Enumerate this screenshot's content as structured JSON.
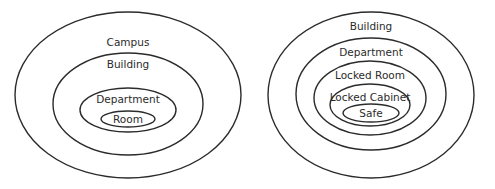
{
  "diagrams": [
    {
      "name": "campus-hierarchy",
      "levels": [
        {
          "label": "Campus",
          "cx": 128,
          "cy": 95,
          "rx": 113,
          "ry": 83,
          "tx": 128,
          "ty": 46
        },
        {
          "label": "Building",
          "cx": 128,
          "cy": 104,
          "rx": 75,
          "ry": 51,
          "tx": 128,
          "ty": 68
        },
        {
          "label": "Department",
          "cx": 128,
          "cy": 110,
          "rx": 48,
          "ry": 22,
          "tx": 128,
          "ty": 103
        },
        {
          "label": "Room",
          "cx": 128,
          "cy": 119,
          "rx": 27,
          "ry": 8,
          "tx": 128,
          "ty": 123
        }
      ]
    },
    {
      "name": "building-hierarchy",
      "levels": [
        {
          "label": "Building",
          "cx": 371,
          "cy": 95,
          "rx": 103,
          "ry": 83,
          "tx": 371,
          "ty": 30
        },
        {
          "label": "Department",
          "cx": 371,
          "cy": 94,
          "rx": 75,
          "ry": 56,
          "tx": 371,
          "ty": 56
        },
        {
          "label": "Locked Room",
          "cx": 370,
          "cy": 98,
          "rx": 56,
          "ry": 37,
          "tx": 370,
          "ty": 79
        },
        {
          "label": "Locked Cabinet",
          "cx": 370,
          "cy": 105,
          "rx": 40,
          "ry": 21,
          "tx": 370,
          "ty": 101
        },
        {
          "label": "Safe",
          "cx": 371,
          "cy": 113,
          "rx": 28,
          "ry": 9,
          "tx": 371,
          "ty": 117
        }
      ]
    }
  ],
  "colors": {
    "stroke": "#2b2b2b",
    "background": "#ffffff"
  }
}
